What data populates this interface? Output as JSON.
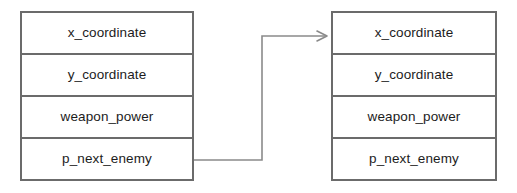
{
  "diagram": {
    "type": "linked-list-node-diagram",
    "background_color": "#ffffff",
    "border_color": "#6b6b6b",
    "connector_color": "#8a8a8a",
    "text_color": "#1c1c1c",
    "nodes": [
      {
        "id": "node-left",
        "name": "enemy-record-left",
        "fields": [
          {
            "label": "x_coordinate"
          },
          {
            "label": "y_coordinate"
          },
          {
            "label": "weapon_power"
          },
          {
            "label": "p_next_enemy"
          }
        ]
      },
      {
        "id": "node-right",
        "name": "enemy-record-right",
        "fields": [
          {
            "label": "x_coordinate"
          },
          {
            "label": "y_coordinate"
          },
          {
            "label": "weapon_power"
          },
          {
            "label": "p_next_enemy"
          }
        ]
      }
    ],
    "connector": {
      "name": "pointer-arrow",
      "from_field": "p_next_enemy",
      "to_field": "x_coordinate",
      "arrowhead": "open-v"
    }
  }
}
